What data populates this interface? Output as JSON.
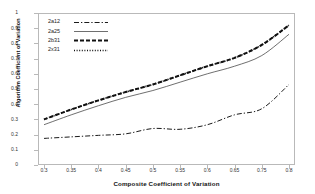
{
  "chart_data": {
    "type": "line",
    "title": "",
    "xlabel": "Composite Coefficient of Variation",
    "ylabel": "Algorithm Coefficient of Variation",
    "categories": [
      "0.3",
      "0.35",
      "0.4",
      "0.45",
      "0.5",
      "0.55",
      "0.6",
      "0.65",
      "0.75",
      "0.8"
    ],
    "x": [
      0.3,
      0.35,
      0.4,
      0.45,
      0.5,
      0.55,
      0.6,
      0.65,
      0.75,
      0.8
    ],
    "ylim": [
      0,
      1
    ],
    "yticks": [
      "0",
      "0.1",
      "0.2",
      "0.3",
      "0.4",
      "0.5",
      "0.6",
      "0.7",
      "0.8",
      "0.9",
      "1"
    ],
    "grid": false,
    "legend_position": "top-left-inside",
    "series": [
      {
        "name": "2a12",
        "style": "dash-dot",
        "values": [
          0.175,
          0.185,
          0.195,
          0.205,
          0.24,
          0.235,
          0.265,
          0.33,
          0.37,
          0.53
        ]
      },
      {
        "name": "2a25",
        "style": "solid",
        "values": [
          0.265,
          0.33,
          0.39,
          0.445,
          0.49,
          0.545,
          0.6,
          0.65,
          0.72,
          0.86
        ]
      },
      {
        "name": "2b31",
        "style": "dashed",
        "values": [
          0.3,
          0.365,
          0.425,
          0.48,
          0.53,
          0.59,
          0.65,
          0.705,
          0.79,
          0.92
        ]
      },
      {
        "name": "2x31",
        "style": "dotted",
        "values": [
          0.3,
          0.365,
          0.425,
          0.48,
          0.53,
          0.59,
          0.65,
          0.705,
          0.79,
          0.92
        ]
      }
    ]
  },
  "legend": {
    "items": [
      {
        "label": "2a12"
      },
      {
        "label": "2a25"
      },
      {
        "label": "2b31"
      },
      {
        "label": "2x31"
      }
    ]
  }
}
